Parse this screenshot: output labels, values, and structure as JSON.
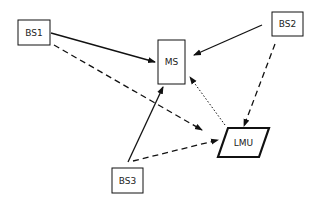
{
  "diagram": {
    "nodes": [
      {
        "id": "BS1",
        "label": "BS1",
        "shape": "rectangle"
      },
      {
        "id": "BS2",
        "label": "BS2",
        "shape": "rectangle"
      },
      {
        "id": "BS3",
        "label": "BS3",
        "shape": "rectangle"
      },
      {
        "id": "MS",
        "label": "MS",
        "shape": "rectangle"
      },
      {
        "id": "LMU",
        "label": "LMU",
        "shape": "parallelogram"
      }
    ],
    "edges": [
      {
        "from": "BS1",
        "to": "MS",
        "style": "solid"
      },
      {
        "from": "BS2",
        "to": "MS",
        "style": "solid"
      },
      {
        "from": "BS3",
        "to": "MS",
        "style": "solid"
      },
      {
        "from": "BS1",
        "to": "LMU",
        "style": "dashed"
      },
      {
        "from": "BS2",
        "to": "LMU",
        "style": "dashed"
      },
      {
        "from": "BS3",
        "to": "LMU",
        "style": "dashed"
      },
      {
        "from": "LMU",
        "to": "MS",
        "style": "dotted"
      }
    ],
    "colors": {
      "stroke": "#111111",
      "background": "#ffffff"
    }
  }
}
